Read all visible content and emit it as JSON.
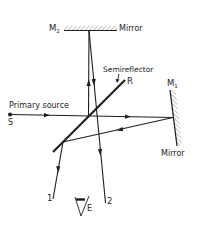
{
  "diagram": {
    "type": "michelson-interferometer",
    "colors": {
      "ink": "#1e1e1e",
      "hatch": "#9a9a9a",
      "background": "#ffffff"
    },
    "labels": {
      "m2_main": "M",
      "m2_sub": "2",
      "m2_mirror": "Mirror",
      "semireflector": "Semireflector",
      "r": "R",
      "m1_main": "M",
      "m1_sub": "1",
      "m1_mirror": "Mirror",
      "primary_source": "Primary source",
      "s": "S",
      "beam1": "1",
      "beam2": "2",
      "eye": "E"
    },
    "components": [
      {
        "id": "M2",
        "kind": "mirror",
        "orientation": "horizontal",
        "label": "Mirror"
      },
      {
        "id": "M1",
        "kind": "mirror",
        "orientation": "near-vertical, slightly tilted",
        "label": "Mirror"
      },
      {
        "id": "R",
        "kind": "semireflector",
        "orientation": "diagonal",
        "label": "Semireflector"
      },
      {
        "id": "S",
        "kind": "point-source",
        "label": "Primary source"
      },
      {
        "id": "E",
        "kind": "eye",
        "label": "E"
      }
    ],
    "beams": [
      {
        "from": "S",
        "to": "R",
        "direction": "right"
      },
      {
        "from": "R",
        "to": "M1",
        "direction": "right"
      },
      {
        "from": "M1",
        "to": "R",
        "direction": "left"
      },
      {
        "from": "R",
        "to": "M2",
        "direction": "up"
      },
      {
        "from": "M2",
        "to": "2",
        "direction": "down"
      },
      {
        "from": "R",
        "to": "1",
        "direction": "down"
      }
    ]
  }
}
